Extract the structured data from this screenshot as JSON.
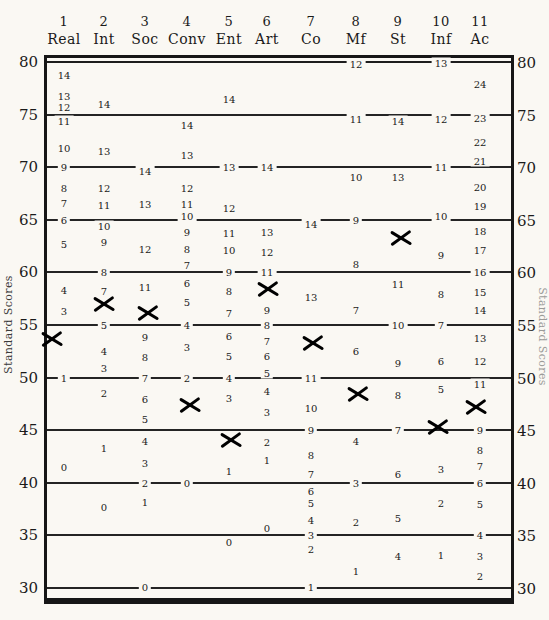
{
  "axis": {
    "label_left": "Standard Scores",
    "label_right": "Standard Scores",
    "ticks": [
      80,
      75,
      70,
      65,
      60,
      55,
      50,
      45,
      40,
      35,
      30
    ]
  },
  "chart_data": {
    "type": "scatter",
    "title": "",
    "ylabel": "Standard Scores",
    "ylim": [
      30,
      80
    ],
    "yticks": [
      80,
      75,
      70,
      65,
      60,
      55,
      50,
      45,
      40,
      35,
      30
    ],
    "grid": true,
    "categories": [
      "Real",
      "Int",
      "Soc",
      "Conv",
      "Ent",
      "Art",
      "Co",
      "Mf",
      "St",
      "Inf",
      "Ac"
    ],
    "column_numbers": [
      "1",
      "2",
      "3",
      "4",
      "5",
      "6",
      "7",
      "8",
      "9",
      "10",
      "11"
    ],
    "series": [
      {
        "name": "X marks (plotted profile, standard scores)",
        "values": [
          53.7,
          57.0,
          56.1,
          47.4,
          44.1,
          58.4,
          53.3,
          48.4,
          63.3,
          45.3,
          47.2
        ]
      }
    ],
    "columns": [
      {
        "num": "1",
        "label": "Real",
        "mark_std": 53.7,
        "scale": [
          [
            14,
            78.8
          ],
          [
            13,
            76.8
          ],
          [
            12,
            75.7
          ],
          [
            11,
            74.4
          ],
          [
            10,
            71.8
          ],
          [
            9,
            70
          ],
          [
            8,
            68
          ],
          [
            7,
            66.6
          ],
          [
            6,
            65
          ],
          [
            5,
            62.7
          ],
          [
            4,
            58.3
          ],
          [
            3,
            56.3
          ],
          [
            1,
            50
          ],
          [
            0,
            41.5
          ]
        ]
      },
      {
        "num": "2",
        "label": "Int",
        "mark_std": 57.0,
        "scale": [
          [
            14,
            76
          ],
          [
            13,
            71.5
          ],
          [
            12,
            68
          ],
          [
            11,
            66.4
          ],
          [
            10,
            64.4
          ],
          [
            9,
            62.9
          ],
          [
            8,
            60
          ],
          [
            7,
            58.2
          ],
          [
            5,
            55
          ],
          [
            4,
            52.5
          ],
          [
            3,
            50.9
          ],
          [
            2,
            48.5
          ],
          [
            1,
            43.3
          ],
          [
            0,
            37.7
          ]
        ]
      },
      {
        "num": "3",
        "label": "Soc",
        "mark_std": 56.1,
        "scale": [
          [
            14,
            69.6
          ],
          [
            13,
            66.5
          ],
          [
            12,
            62.2
          ],
          [
            11,
            58.6
          ],
          [
            9,
            53.9
          ],
          [
            8,
            52
          ],
          [
            7,
            50
          ],
          [
            6,
            48
          ],
          [
            5,
            46.1
          ],
          [
            4,
            44
          ],
          [
            3,
            41.9
          ],
          [
            2,
            40
          ],
          [
            1,
            38.2
          ],
          [
            0,
            30.1
          ]
        ]
      },
      {
        "num": "4",
        "label": "Conv",
        "mark_std": 47.4,
        "scale": [
          [
            14,
            74
          ],
          [
            13,
            71.2
          ],
          [
            12,
            68
          ],
          [
            11,
            66.5
          ],
          [
            10,
            65.4
          ],
          [
            9,
            63.8
          ],
          [
            8,
            62.2
          ],
          [
            7,
            60.7
          ],
          [
            6,
            59
          ],
          [
            5,
            57.2
          ],
          [
            4,
            55
          ],
          [
            3,
            52.9
          ],
          [
            2,
            50
          ],
          [
            0,
            40
          ]
        ]
      },
      {
        "num": "5",
        "label": "Ent",
        "mark_std": 44.1,
        "scale": [
          [
            14,
            76.5
          ],
          [
            13,
            70
          ],
          [
            12,
            66.1
          ],
          [
            11,
            63.7
          ],
          [
            10,
            62.1
          ],
          [
            9,
            60
          ],
          [
            8,
            58.2
          ],
          [
            7,
            56.1
          ],
          [
            6,
            54
          ],
          [
            5,
            52.1
          ],
          [
            4,
            50
          ],
          [
            3,
            48.1
          ],
          [
            1,
            41.1
          ],
          [
            0,
            34.4
          ]
        ]
      },
      {
        "num": "6",
        "label": "Art",
        "mark_std": 58.4,
        "scale": [
          [
            14,
            70
          ],
          [
            13,
            63.8
          ],
          [
            12,
            61.9
          ],
          [
            11,
            60
          ],
          [
            9,
            56.4
          ],
          [
            8,
            55
          ],
          [
            7,
            53.5
          ],
          [
            6,
            52.1
          ],
          [
            5,
            50.4
          ],
          [
            4,
            48.7
          ],
          [
            3,
            46.7
          ],
          [
            2,
            43.9
          ],
          [
            1,
            42.2
          ],
          [
            0,
            35.7
          ]
        ]
      },
      {
        "num": "7",
        "label": "Co",
        "mark_std": 53.3,
        "scale": [
          [
            14,
            64.6
          ],
          [
            13,
            57.7
          ],
          [
            11,
            50
          ],
          [
            10,
            47.1
          ],
          [
            9,
            45
          ],
          [
            8,
            42.6
          ],
          [
            7,
            40.8
          ],
          [
            6,
            39.2
          ],
          [
            5,
            38.1
          ],
          [
            4,
            36.5
          ],
          [
            3,
            35
          ],
          [
            2,
            33.7
          ],
          [
            1,
            30.1
          ]
        ]
      },
      {
        "num": "8",
        "label": "Mf",
        "mark_std": 48.4,
        "scale": [
          [
            12,
            79.8
          ],
          [
            11,
            74.6
          ],
          [
            10,
            69.1
          ],
          [
            9,
            65
          ],
          [
            8,
            60.8
          ],
          [
            7,
            56.4
          ],
          [
            6,
            52.5
          ],
          [
            4,
            44
          ],
          [
            3,
            40
          ],
          [
            2,
            36.3
          ],
          [
            1,
            31.6
          ]
        ]
      },
      {
        "num": "9",
        "label": "St",
        "mark_std": 63.3,
        "scale": [
          [
            14,
            74.4
          ],
          [
            13,
            69.1
          ],
          [
            11,
            58.9
          ],
          [
            10,
            55
          ],
          [
            9,
            51.4
          ],
          [
            8,
            48.3
          ],
          [
            7,
            45
          ],
          [
            6,
            40.8
          ],
          [
            5,
            36.7
          ],
          [
            4,
            33
          ]
        ]
      },
      {
        "num": "10",
        "label": "Inf",
        "mark_std": 45.3,
        "scale": [
          [
            13,
            79.9
          ],
          [
            12,
            74.6
          ],
          [
            11,
            70
          ],
          [
            10,
            65.4
          ],
          [
            9,
            61.7
          ],
          [
            8,
            57.9
          ],
          [
            7,
            55
          ],
          [
            6,
            51.6
          ],
          [
            5,
            48.9
          ],
          [
            3,
            41.3
          ],
          [
            2,
            38.1
          ],
          [
            1,
            33.1
          ]
        ]
      },
      {
        "num": "11",
        "label": "Ac",
        "mark_std": 47.2,
        "scale": [
          [
            24,
            77.9
          ],
          [
            23,
            74.7
          ],
          [
            22,
            72.4
          ],
          [
            21,
            70.6
          ],
          [
            20,
            68.1
          ],
          [
            19,
            66.3
          ],
          [
            18,
            63.9
          ],
          [
            17,
            62.1
          ],
          [
            16,
            60
          ],
          [
            15,
            58.1
          ],
          [
            14,
            56.4
          ],
          [
            13,
            53.8
          ],
          [
            12,
            51.6
          ],
          [
            11,
            49.4
          ],
          [
            9,
            45
          ],
          [
            8,
            43.1
          ],
          [
            7,
            41.6
          ],
          [
            6,
            40
          ],
          [
            5,
            38
          ],
          [
            4,
            35
          ],
          [
            3,
            33
          ],
          [
            2,
            31.1
          ]
        ]
      }
    ]
  }
}
